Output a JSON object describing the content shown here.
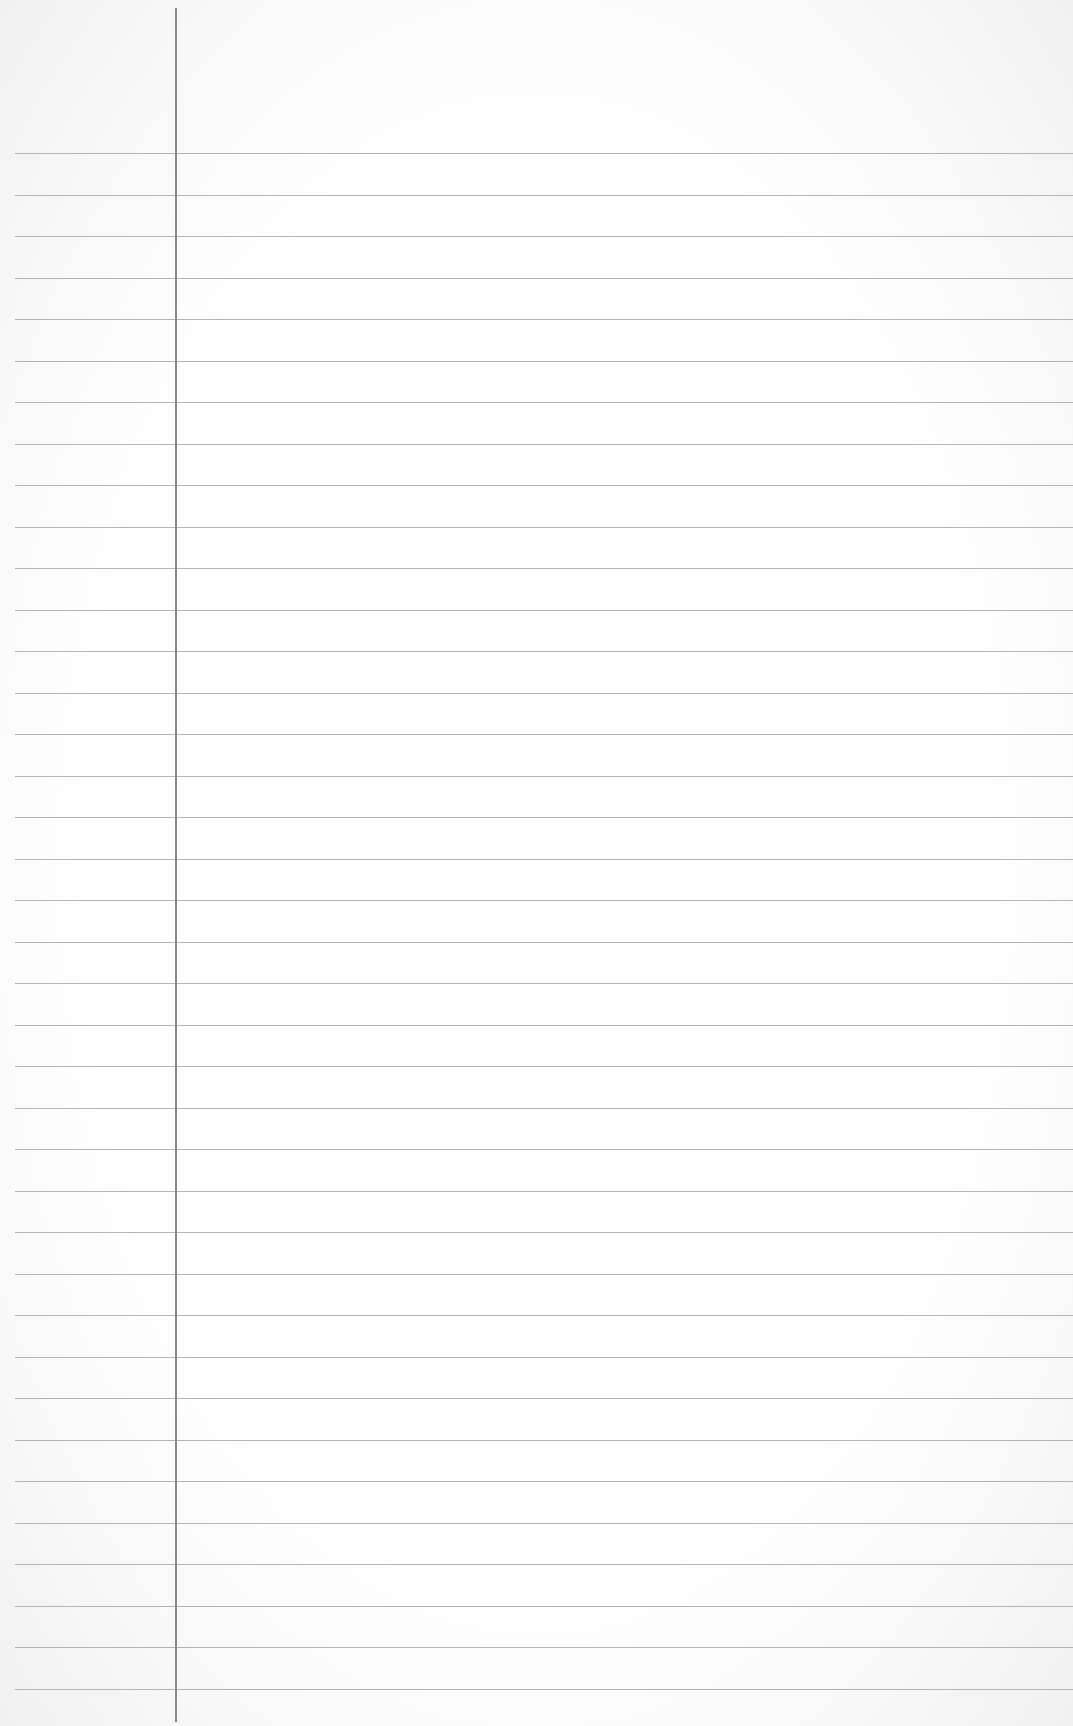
{
  "page": {
    "type": "lined-paper",
    "background_color": "#ffffff",
    "rule_color": "#a9a9a9",
    "margin_line_color": "#8a8a8a",
    "rule_count": 38,
    "first_rule_y": 153,
    "rule_spacing": 41.5,
    "margin_line_x": 175,
    "text": []
  }
}
